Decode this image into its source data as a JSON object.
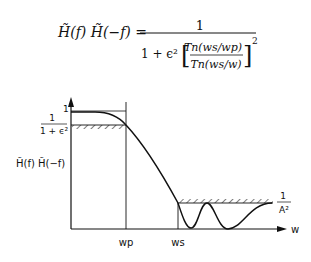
{
  "equation": {
    "lhs": "H̃(f) H̃(−f) =",
    "numerator": "1",
    "denominator_prefix": "1 + ϵ²",
    "inner_numerator": "Tn(ws/wp)",
    "inner_denominator": "Tn(ws/w)",
    "exponent": "2"
  },
  "plot": {
    "y_axis_label": "H̃(f) H̃(−f)",
    "y_tick_1": "1",
    "passband_level_num": "1",
    "passband_level_den": "1 + ϵ²",
    "stopband_level_num": "1",
    "stopband_level_den": "A²",
    "x_axis_label": "w",
    "wp_label": "wp",
    "ws_label": "ws"
  }
}
